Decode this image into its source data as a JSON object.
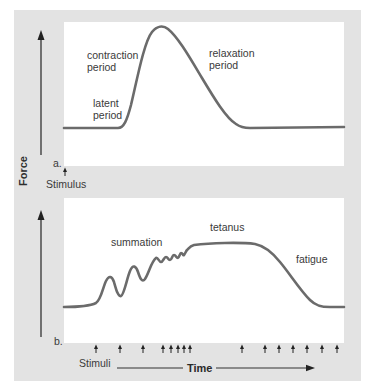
{
  "figure": {
    "y_axis_label": "Force",
    "panel_a": {
      "letter": "a.",
      "labels": {
        "contraction_line1": "contraction",
        "contraction_line2": "period",
        "latent_line1": "latent",
        "latent_line2": "period",
        "relaxation_line1": "relaxation",
        "relaxation_line2": "period"
      },
      "stimulus_label": "Stimulus",
      "curve_description": "single muscle twitch: flat baseline, latent period, steep contraction to peak, slower relaxation back to baseline"
    },
    "panel_b": {
      "letter": "b.",
      "labels": {
        "summation": "summation",
        "tetanus": "tetanus",
        "fatigue": "fatigue"
      },
      "stimuli_label": "Stimuli",
      "time_label": "Time",
      "stimuli_count": 15,
      "curve_description": "summation of twitches rising to sustained tetanus plateau, then declining with fatigue"
    },
    "colors": {
      "background_gray": "#e3e3e3",
      "panel_white": "#ffffff",
      "curve": "#6b6b6b",
      "axis": "#333333",
      "text": "#3a3a3a"
    }
  }
}
